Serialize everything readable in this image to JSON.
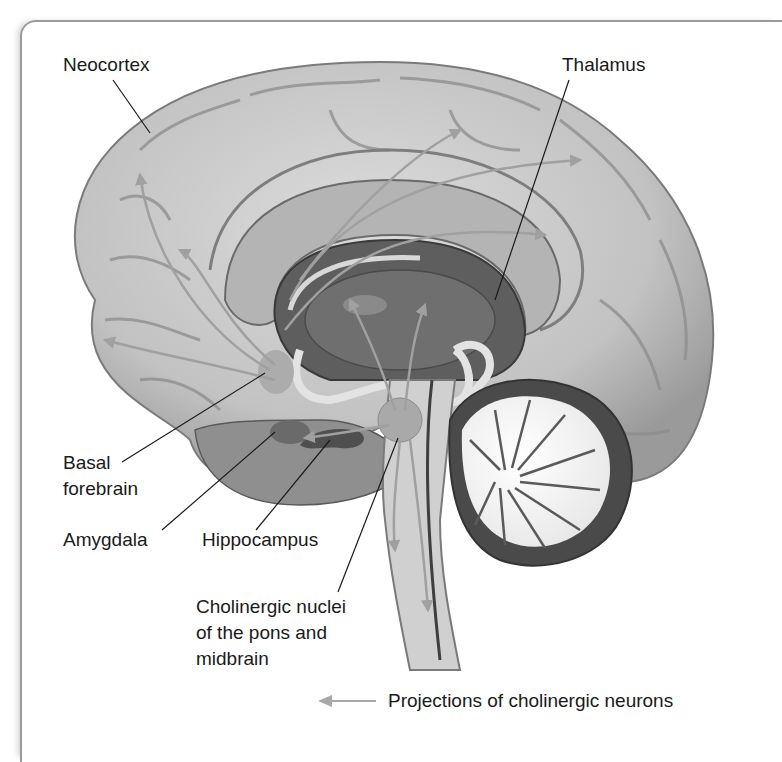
{
  "figure": {
    "labels": {
      "neocortex": "Neocortex",
      "thalamus": "Thalamus",
      "basal_forebrain_line1": "Basal",
      "basal_forebrain_line2": "forebrain",
      "amygdala": "Amygdala",
      "hippocampus": "Hippocampus",
      "cholinergic_line1": "Cholinergic nuclei",
      "cholinergic_line2": "of the pons and",
      "cholinergic_line3": "midbrain"
    },
    "legend": {
      "arrow_label": "Projections of cholinergic neurons",
      "arrow_color": "#a8a8a8"
    },
    "colors": {
      "cortex": "#c8c8c8",
      "cortex_shadow": "#8e8e8e",
      "corpus_callosum": "#b4b4b4",
      "ventricle": "#5e5e5e",
      "thalamus": "#6f6f6f",
      "cerebellum_white": "#f6f6f6",
      "cerebellum_dark": "#4a4a4a",
      "brainstem": "#d0d0d0",
      "nuclei": "#a9a9a9",
      "frame": "#9a9a9a",
      "text": "#1a1a1a"
    }
  }
}
